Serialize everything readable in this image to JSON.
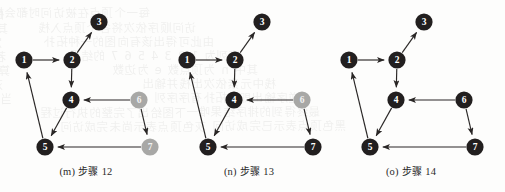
{
  "figure": {
    "background_color": "#fdfdfc",
    "node_dark_color": "#221f1f",
    "node_grey_color": "#a8a8a6",
    "edge_color": "#2a2726",
    "node_radius": 8.6,
    "bleed_lines": [
      {
        "x": 4,
        "y": 6,
        "text": "的参数表示为有向图的遍历过程中每"
      },
      {
        "x": 150,
        "y": 4,
        "text": "每一个顶点在被访问时都会标记"
      },
      {
        "x": 8,
        "y": 20,
        "text": "其中深度优先搜索算法按照下列"
      },
      {
        "x": 196,
        "y": 19,
        "text": "访问顺序依次将各个顶点入栈"
      },
      {
        "x": 2,
        "y": 34,
        "text": "定义图的邻接表结构之后再实现"
      },
      {
        "x": 214,
        "y": 33,
        "text": "由此可得出该有向图的一种拓扑"
      },
      {
        "x": 6,
        "y": 48,
        "text": "若图中存在回路则无法完成排序"
      },
      {
        "x": 240,
        "y": 47,
        "text": "序列为 1 2 3 4 5 6 7 的结果"
      },
      {
        "x": 10,
        "y": 62,
        "text": "算法的时间复杂度为 O(n+e)"
      },
      {
        "x": 258,
        "y": 61,
        "text": "其中 n 为顶点数 e 为边数"
      },
      {
        "x": 3,
        "y": 76,
        "text": "对每个未被访问的邻接顶点递归"
      },
      {
        "x": 276,
        "y": 75,
        "text": "栈中元素依次出栈并输出"
      },
      {
        "x": 12,
        "y": 90,
        "text": "当所有顶点都被访问后算法结束"
      },
      {
        "x": 300,
        "y": 89,
        "text": "逆序输出即为拓扑有序序列"
      },
      {
        "x": 186,
        "y": 104,
        "text": "下图给出了完整的执行过程"
      },
      {
        "x": 320,
        "y": 103,
        "text": "最终得到的排序结果唯一"
      },
      {
        "x": 206,
        "y": 118,
        "text": "灰色顶点表示尚未完成访问"
      },
      {
        "x": 346,
        "y": 117,
        "text": "黑色顶点表示已完成访问"
      }
    ]
  },
  "panels": [
    {
      "id": "m",
      "caption_index": "(m)",
      "caption_label": "步骤",
      "caption_step": "12",
      "nodes": [
        {
          "id": "1",
          "label": "1",
          "x": 22,
          "y": 60,
          "state": "visited"
        },
        {
          "id": "2",
          "label": "2",
          "x": 70,
          "y": 60,
          "state": "visited"
        },
        {
          "id": "3",
          "label": "3",
          "x": 97,
          "y": 22,
          "state": "visited"
        },
        {
          "id": "4",
          "label": "4",
          "x": 69,
          "y": 100,
          "state": "visited"
        },
        {
          "id": "5",
          "label": "5",
          "x": 43,
          "y": 147,
          "state": "visited"
        },
        {
          "id": "6",
          "label": "6",
          "x": 137,
          "y": 100,
          "state": "pending"
        },
        {
          "id": "7",
          "label": "7",
          "x": 148,
          "y": 147,
          "state": "pending"
        }
      ],
      "edges": [
        {
          "from": "1",
          "to": "2"
        },
        {
          "from": "2",
          "to": "3"
        },
        {
          "from": "2",
          "to": "4"
        },
        {
          "from": "6",
          "to": "4"
        },
        {
          "from": "4",
          "to": "5"
        },
        {
          "from": "5",
          "to": "1"
        },
        {
          "from": "6",
          "to": "7"
        },
        {
          "from": "7",
          "to": "5"
        }
      ]
    },
    {
      "id": "n",
      "caption_index": "(n)",
      "caption_label": "步骤",
      "caption_step": "13",
      "nodes": [
        {
          "id": "1",
          "label": "1",
          "x": 22,
          "y": 60,
          "state": "visited"
        },
        {
          "id": "2",
          "label": "2",
          "x": 70,
          "y": 60,
          "state": "visited"
        },
        {
          "id": "3",
          "label": "3",
          "x": 97,
          "y": 22,
          "state": "visited"
        },
        {
          "id": "4",
          "label": "4",
          "x": 69,
          "y": 100,
          "state": "visited"
        },
        {
          "id": "5",
          "label": "5",
          "x": 43,
          "y": 147,
          "state": "visited"
        },
        {
          "id": "6",
          "label": "6",
          "x": 137,
          "y": 100,
          "state": "pending"
        },
        {
          "id": "7",
          "label": "7",
          "x": 148,
          "y": 147,
          "state": "visited"
        }
      ],
      "edges": [
        {
          "from": "1",
          "to": "2"
        },
        {
          "from": "2",
          "to": "3"
        },
        {
          "from": "2",
          "to": "4"
        },
        {
          "from": "6",
          "to": "4"
        },
        {
          "from": "4",
          "to": "5"
        },
        {
          "from": "5",
          "to": "1"
        },
        {
          "from": "6",
          "to": "7"
        },
        {
          "from": "7",
          "to": "5"
        }
      ]
    },
    {
      "id": "o",
      "caption_index": "(o)",
      "caption_label": "步骤",
      "caption_step": "14",
      "nodes": [
        {
          "id": "1",
          "label": "1",
          "x": 22,
          "y": 60,
          "state": "visited"
        },
        {
          "id": "2",
          "label": "2",
          "x": 70,
          "y": 60,
          "state": "visited"
        },
        {
          "id": "3",
          "label": "3",
          "x": 97,
          "y": 22,
          "state": "visited"
        },
        {
          "id": "4",
          "label": "4",
          "x": 69,
          "y": 100,
          "state": "visited"
        },
        {
          "id": "5",
          "label": "5",
          "x": 43,
          "y": 147,
          "state": "visited"
        },
        {
          "id": "6",
          "label": "6",
          "x": 137,
          "y": 100,
          "state": "visited"
        },
        {
          "id": "7",
          "label": "7",
          "x": 148,
          "y": 147,
          "state": "visited"
        }
      ],
      "edges": [
        {
          "from": "1",
          "to": "2"
        },
        {
          "from": "2",
          "to": "3"
        },
        {
          "from": "2",
          "to": "4"
        },
        {
          "from": "6",
          "to": "4"
        },
        {
          "from": "4",
          "to": "5"
        },
        {
          "from": "5",
          "to": "1"
        },
        {
          "from": "6",
          "to": "7"
        },
        {
          "from": "7",
          "to": "5"
        }
      ]
    }
  ]
}
